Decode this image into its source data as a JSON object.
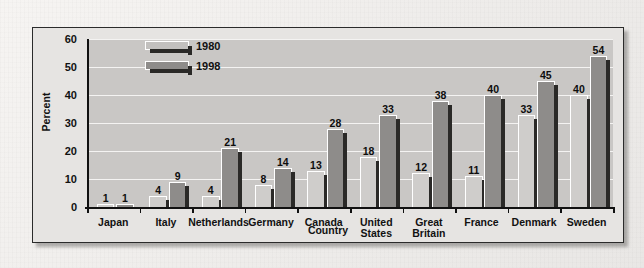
{
  "chart_data": {
    "type": "bar",
    "title": "",
    "xlabel": "Country",
    "ylabel": "Percent",
    "ylim": [
      0,
      60
    ],
    "yticks": [
      0,
      10,
      20,
      30,
      40,
      50,
      60
    ],
    "grid": true,
    "legend_position": "top-left",
    "categories": [
      "Japan",
      "Italy",
      "Netherlands",
      "Germany",
      "Canada",
      "United States",
      "Great Britain",
      "France",
      "Denmark",
      "Sweden"
    ],
    "series": [
      {
        "name": "1980",
        "color": "#cfcdcb",
        "values": [
          1,
          4,
          4,
          8,
          13,
          18,
          12,
          11,
          33,
          40
        ]
      },
      {
        "name": "1998",
        "color": "#8e8c8a",
        "values": [
          1,
          9,
          21,
          14,
          28,
          33,
          38,
          40,
          45,
          54
        ]
      }
    ]
  },
  "legend": {
    "items": [
      {
        "label": "1980"
      },
      {
        "label": "1998"
      }
    ]
  },
  "colors": {
    "plot_background": "#c9c7c5",
    "figure_background": "#e6e4e2",
    "page_background": "#f2f0ee",
    "gridline": "#f4f3f2",
    "axis": "#111111",
    "bar_shadow": "#2a2927"
  }
}
